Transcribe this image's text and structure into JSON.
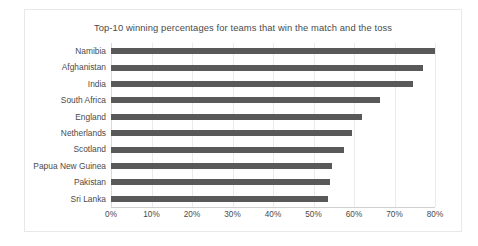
{
  "chart_data": {
    "type": "bar",
    "orientation": "horizontal",
    "title": "Top-10 winning percentages for teams that win the match and the toss",
    "xlabel": "",
    "ylabel": "",
    "xlim": [
      0,
      80
    ],
    "xtick_labels": [
      "0%",
      "10%",
      "20%",
      "30%",
      "40%",
      "50%",
      "60%",
      "70%",
      "80%"
    ],
    "xtick_values": [
      0,
      10,
      20,
      30,
      40,
      50,
      60,
      70,
      80
    ],
    "grid": true,
    "legend": false,
    "bar_color": "#595959",
    "categories": [
      "Namibia",
      "Afghanistan",
      "India",
      "South Africa",
      "England",
      "Netherlands",
      "Scotland",
      "Papua New Guinea",
      "Pakistan",
      "Sri Lanka"
    ],
    "values": [
      80.0,
      77.0,
      74.5,
      66.5,
      62.0,
      59.5,
      57.5,
      54.5,
      54.0,
      53.5
    ],
    "series": [
      {
        "name": "Winning percentage",
        "values": [
          80.0,
          77.0,
          74.5,
          66.5,
          62.0,
          59.5,
          57.5,
          54.5,
          54.0,
          53.5
        ]
      }
    ]
  }
}
